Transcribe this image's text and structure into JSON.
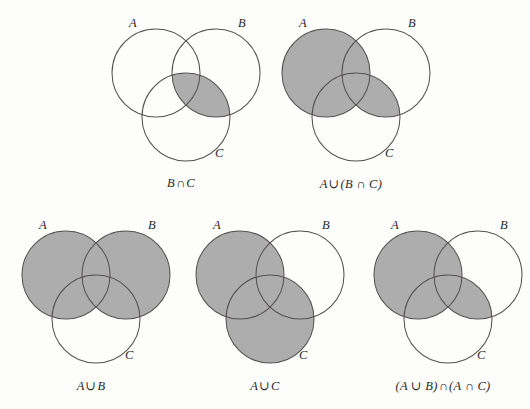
{
  "figure": {
    "background_color": "#fdfdfc",
    "shade_color": "#adadad",
    "outline_color": "#555153",
    "rows": 2,
    "diagram_count": 5
  },
  "diagrams": [
    {
      "id": "b-inter-c",
      "caption": "B ∩ C",
      "caption_parts": {
        "lhs": "B",
        "op": "∩",
        "rhs": "C"
      },
      "set_labels": {
        "a": "A",
        "b": "B",
        "c": "C"
      },
      "shaded_description": "intersection of B and C only",
      "shaded_regions": [
        "B∩C"
      ]
    },
    {
      "id": "a-union-b-inter-c",
      "caption": "A ∪ (B ∩ C)",
      "caption_parts": {
        "lhs": "A",
        "op": "∪",
        "rhs": "(B ∩ C)"
      },
      "set_labels": {
        "a": "A",
        "b": "B",
        "c": "C"
      },
      "shaded_description": "all of A together with the intersection of B and C",
      "shaded_regions": [
        "A",
        "B∩C"
      ]
    },
    {
      "id": "a-union-b",
      "caption": "A ∪ B",
      "caption_parts": {
        "lhs": "A",
        "op": "∪",
        "rhs": "B"
      },
      "set_labels": {
        "a": "A",
        "b": "B",
        "c": "C"
      },
      "shaded_description": "all of A together with all of B",
      "shaded_regions": [
        "A",
        "B"
      ]
    },
    {
      "id": "a-union-c",
      "caption": "A ∪ C",
      "caption_parts": {
        "lhs": "A",
        "op": "∪",
        "rhs": "C"
      },
      "set_labels": {
        "a": "A",
        "b": "B",
        "c": "C"
      },
      "shaded_description": "all of A together with all of C",
      "shaded_regions": [
        "A",
        "C"
      ]
    },
    {
      "id": "a-union-b-inter-a-inter-c",
      "caption": "(A ∪ B) ∩ (A ∩ C)",
      "caption_parts": {
        "lhs": "(A ∪ B)",
        "op": "∩",
        "rhs": "(A ∩ C)"
      },
      "set_labels": {
        "a": "A",
        "b": "B",
        "c": "C"
      },
      "shaded_description": "all of A together with the intersection of B and C",
      "shaded_regions": [
        "A",
        "B∩C"
      ]
    }
  ]
}
